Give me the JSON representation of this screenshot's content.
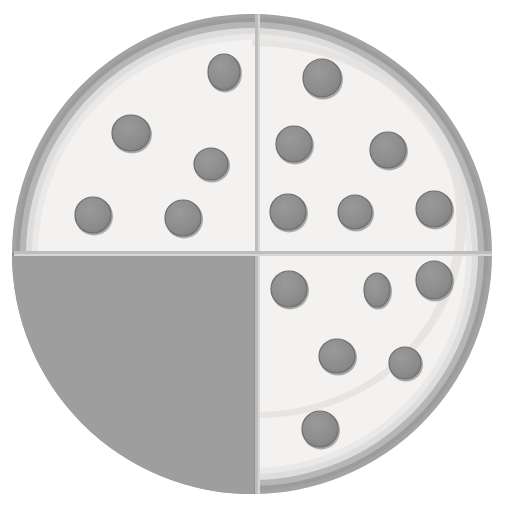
{
  "scene": {
    "title": "Quartered pizza with missing slice",
    "canvas": {
      "width": 505,
      "height": 513,
      "background": "#ffffff"
    }
  },
  "pizza": {
    "name": "pizza",
    "center": {
      "x": 252,
      "y": 254
    },
    "outer_radius": 240,
    "colors": {
      "outer_crust_dark": "#a0a0a0",
      "outer_crust_mid": "#b5b5b5",
      "crust_highlight": "#dedede",
      "crust_inner_light": "#eceaea",
      "cheese": "#f2f1ef",
      "empty_slice": "#9e9e9e",
      "empty_slice_edge": "#8c8c8c",
      "pepperoni_fill": "#8d8d8d",
      "pepperoni_stroke": "#6f6f6f",
      "cut_line": "#bdbdbd"
    },
    "rings": [
      {
        "name": "outer-crust-ring",
        "radius": 240,
        "fill": "#a0a0a0"
      },
      {
        "name": "crust-mid-ring",
        "radius": 233,
        "fill": "#b4b4b4"
      },
      {
        "name": "crust-highlight-ring",
        "radius": 226,
        "fill": "#dcdcdc"
      },
      {
        "name": "crust-inner-ring",
        "radius": 219,
        "fill": "#e8e6e4"
      },
      {
        "name": "cheese-disc",
        "radius": 213,
        "fill": "#f2f1ef"
      }
    ],
    "cut_lines": {
      "vertical_x": 257,
      "horizontal_y": 253,
      "thickness": 4,
      "color": "#bdbdbd"
    },
    "quadrants": [
      {
        "id": "top-left",
        "label": "Top left slice",
        "state": "present",
        "pepperoni_count": 5
      },
      {
        "id": "top-right",
        "label": "Top right slice",
        "state": "present",
        "pepperoni_count": 6
      },
      {
        "id": "bottom-right",
        "label": "Bottom right slice",
        "state": "present",
        "pepperoni_count": 6
      },
      {
        "id": "bottom-left",
        "label": "Bottom left slice",
        "state": "missing",
        "pepperoni_count": 0
      }
    ],
    "pepperoni": [
      {
        "quadrant": "top-left",
        "cx": 224,
        "cy": 72,
        "rx": 16,
        "ry": 18
      },
      {
        "quadrant": "top-left",
        "cx": 131,
        "cy": 133,
        "rx": 19,
        "ry": 18
      },
      {
        "quadrant": "top-left",
        "cx": 211,
        "cy": 164,
        "rx": 17,
        "ry": 16
      },
      {
        "quadrant": "top-left",
        "cx": 93,
        "cy": 215,
        "rx": 18,
        "ry": 18
      },
      {
        "quadrant": "top-left",
        "cx": 183,
        "cy": 218,
        "rx": 18,
        "ry": 18
      },
      {
        "quadrant": "top-right",
        "cx": 322,
        "cy": 78,
        "rx": 19,
        "ry": 19
      },
      {
        "quadrant": "top-right",
        "cx": 294,
        "cy": 144,
        "rx": 18,
        "ry": 18
      },
      {
        "quadrant": "top-right",
        "cx": 388,
        "cy": 150,
        "rx": 18,
        "ry": 18
      },
      {
        "quadrant": "top-right",
        "cx": 288,
        "cy": 212,
        "rx": 18,
        "ry": 18
      },
      {
        "quadrant": "top-right",
        "cx": 355,
        "cy": 212,
        "rx": 17,
        "ry": 17
      },
      {
        "quadrant": "top-right",
        "cx": 434,
        "cy": 209,
        "rx": 18,
        "ry": 18
      },
      {
        "quadrant": "bottom-right",
        "cx": 289,
        "cy": 289,
        "rx": 18,
        "ry": 18
      },
      {
        "quadrant": "bottom-right",
        "cx": 377,
        "cy": 290,
        "rx": 13,
        "ry": 17
      },
      {
        "quadrant": "bottom-right",
        "cx": 434,
        "cy": 280,
        "rx": 18,
        "ry": 19
      },
      {
        "quadrant": "bottom-right",
        "cx": 337,
        "cy": 356,
        "rx": 18,
        "ry": 17
      },
      {
        "quadrant": "bottom-right",
        "cx": 405,
        "cy": 363,
        "rx": 16,
        "ry": 16
      },
      {
        "quadrant": "bottom-right",
        "cx": 320,
        "cy": 429,
        "rx": 18,
        "ry": 18
      }
    ]
  }
}
